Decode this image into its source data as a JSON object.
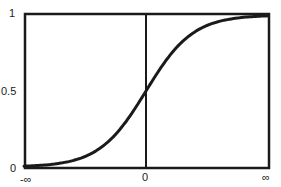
{
  "chart_data": {
    "type": "line",
    "title": "",
    "xlabel": "",
    "ylabel": "",
    "x_tick_labels": [
      "-∞",
      "0",
      "∞"
    ],
    "y_tick_labels": [
      "0",
      "0.5",
      "1"
    ],
    "xlim": [
      "-inf",
      "inf"
    ],
    "ylim": [
      0,
      1
    ],
    "grid": false,
    "legend": null,
    "series": [
      {
        "name": "sigmoid",
        "description": "S-shaped cumulative curve rising from 0 at -∞ to 1 at ∞, passing 0.5 at x=0",
        "x_norm": [
          -1.0,
          -0.8,
          -0.6,
          -0.4,
          -0.2,
          0.0,
          0.2,
          0.4,
          0.6,
          0.8,
          1.0
        ],
        "values": [
          0.0,
          0.03,
          0.08,
          0.2,
          0.36,
          0.5,
          0.66,
          0.83,
          0.96,
          0.99,
          1.0
        ]
      }
    ],
    "vertical_reference_line_at": 0
  },
  "axes": {
    "y_top": "1",
    "y_mid": "0.5",
    "y_bottom": "0",
    "x_left": "-∞",
    "x_center": "0",
    "x_right": "∞"
  }
}
